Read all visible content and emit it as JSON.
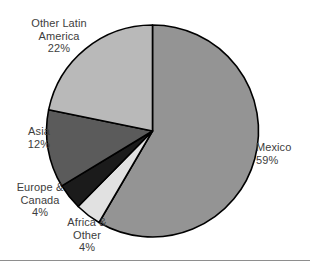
{
  "chart_data": {
    "type": "pie",
    "title": "",
    "subtitle": "",
    "xlabel": "",
    "ylabel": "",
    "legend_position": "none",
    "grid": false,
    "start_angle_deg": 0,
    "direction": "clockwise",
    "units": "percent",
    "categories": [
      "Mexico",
      "Africa & Other",
      "Europe & Canada",
      "Asia",
      "Other Latin America"
    ],
    "values": [
      59,
      4,
      4,
      12,
      22
    ],
    "colors": [
      "#949494",
      "#e1e1e1",
      "#1b1b1b",
      "#5b5b5b",
      "#b9b9b9"
    ],
    "slice_outline_color": "#000000",
    "slices": [
      {
        "name": "Mexico",
        "value": 59,
        "value_label": "59%",
        "color": "#949494",
        "label_lines": [
          "Mexico",
          "59%"
        ],
        "label_position": "right"
      },
      {
        "name": "Africa & Other",
        "value": 4,
        "value_label": "4%",
        "color": "#e1e1e1",
        "label_lines": [
          "Africa &",
          "Other",
          "4%"
        ],
        "label_position": "bottom-left"
      },
      {
        "name": "Europe & Canada",
        "value": 4,
        "value_label": "4%",
        "color": "#1b1b1b",
        "label_lines": [
          "Europe &",
          "Canada",
          "4%"
        ],
        "label_position": "left-lower"
      },
      {
        "name": "Asia",
        "value": 12,
        "value_label": "12%",
        "color": "#5b5b5b",
        "label_lines": [
          "Asia",
          "12%"
        ],
        "label_position": "left"
      },
      {
        "name": "Other Latin America",
        "value": 22,
        "value_label": "22%",
        "color": "#b9b9b9",
        "label_lines": [
          "Other Latin",
          "America",
          "22%"
        ],
        "label_position": "top-left"
      }
    ]
  },
  "labels": {
    "other_latin_america": "Other Latin\nAmerica\n22%",
    "asia": "Asia\n12%",
    "europe_canada": "Europe &\nCanada\n4%",
    "africa_other": "Africa &\nOther\n4%",
    "mexico": "Mexico\n59%"
  }
}
